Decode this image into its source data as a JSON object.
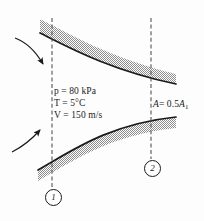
{
  "figure": {
    "background_color": "#fdfdfd",
    "line_color": "#1a1a1a",
    "wall_fill_color": "#a8a8a8",
    "dashed_line_color": "#4d4d4d"
  },
  "annotations": {
    "inlet": {
      "pressure": "p = 80 kPa",
      "pressure_symbol": "p",
      "pressure_value": "80 kPa",
      "temperature": "T = 5°C",
      "temperature_symbol": "T",
      "temperature_value": "5°C",
      "velocity": "V = 150 m/s",
      "velocity_symbol": "V",
      "velocity_value": "150 m/s"
    },
    "exit": {
      "area": "A = 0.5A1",
      "area_symbol": "A",
      "area_value_prefix": "= 0.5",
      "area_ref_symbol": "A",
      "area_ref_sub": "1"
    }
  },
  "stations": [
    {
      "id": "1",
      "label": "1",
      "x": 52,
      "dash_top": 20,
      "dash_bottom": 188
    },
    {
      "id": "2",
      "label": "2",
      "x": 151,
      "dash_top": 20,
      "dash_bottom": 159
    }
  ],
  "flow_arrows": [
    {
      "name": "upper-inlet-arrow",
      "direction": "down-right"
    },
    {
      "name": "lower-inlet-arrow",
      "direction": "up-right"
    }
  ],
  "walls": {
    "upper": {
      "name": "upper-duct-wall",
      "description": "curved converging upper wall, shaded band"
    },
    "lower": {
      "name": "lower-duct-wall",
      "description": "curved converging lower wall, shaded band"
    }
  }
}
